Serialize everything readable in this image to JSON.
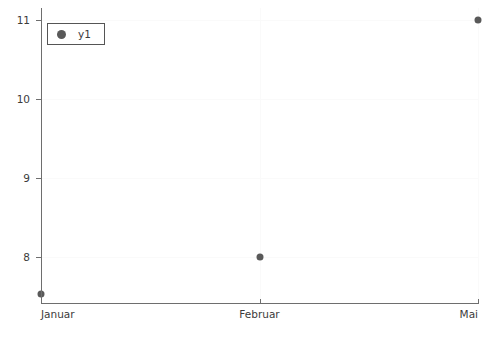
{
  "chart_data": {
    "type": "scatter",
    "title": "",
    "subtitle": "",
    "xlabel": "",
    "ylabel": "",
    "categories": [
      "Januar",
      "Februar",
      "Mai"
    ],
    "series": [
      {
        "name": "y1",
        "values": [
          7.53,
          8,
          11
        ],
        "marker": "circle",
        "color": "#595959"
      }
    ],
    "yticks": [
      8,
      9,
      10,
      11
    ],
    "ytick_labels": [
      "8",
      "9",
      "10",
      "11"
    ],
    "xtick_labels": [
      "Januar",
      "Februar",
      "Mai"
    ],
    "ylim": [
      7.4,
      11.15
    ],
    "grid": true,
    "grid_color": "#fafafa",
    "legend": {
      "position": "top-left",
      "entries": [
        {
          "label": "y1",
          "marker": "circle",
          "color": "#595959"
        }
      ]
    },
    "axis_color": "#6e6e6e",
    "background": "#ffffff"
  }
}
